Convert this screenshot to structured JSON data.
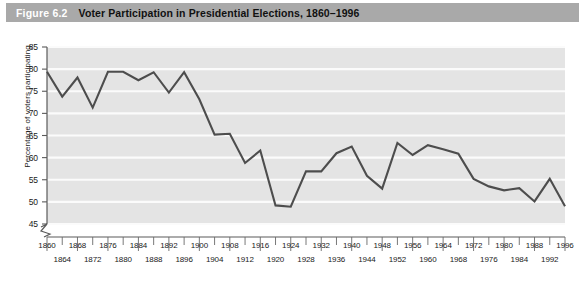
{
  "figure": {
    "number": "Figure 6.2",
    "title": "Voter Participation in Presidential Elections, 1860–1996"
  },
  "colors": {
    "title_bar": "#a9a9a9",
    "figure_number_text": "#ffffff",
    "title_text": "#111111",
    "plot_background": "#e4e4e4",
    "gridline": "#f7f7f7",
    "line": "#4d4d4d",
    "axis": "#5a5a5a",
    "page_background": "#ffffff"
  },
  "chart_data": {
    "type": "line",
    "title": "Voter Participation in Presidential Elections, 1860–1996",
    "xlabel": "",
    "ylabel": "Percentage of voters participating",
    "ylim": [
      45,
      85
    ],
    "yticks": [
      45,
      50,
      55,
      60,
      65,
      70,
      75,
      80,
      85
    ],
    "grid": true,
    "legend": null,
    "axis_break": true,
    "x": [
      1860,
      1864,
      1868,
      1872,
      1876,
      1880,
      1884,
      1888,
      1892,
      1896,
      1900,
      1904,
      1908,
      1912,
      1916,
      1920,
      1924,
      1928,
      1932,
      1936,
      1940,
      1944,
      1948,
      1952,
      1956,
      1960,
      1964,
      1968,
      1972,
      1976,
      1980,
      1984,
      1988,
      1992,
      1996
    ],
    "xticks_top": [
      1860,
      1868,
      1876,
      1884,
      1892,
      1900,
      1908,
      1916,
      1924,
      1932,
      1940,
      1948,
      1956,
      1964,
      1972,
      1980,
      1988,
      1996
    ],
    "xticks_bottom": [
      1864,
      1872,
      1880,
      1888,
      1896,
      1904,
      1912,
      1920,
      1928,
      1936,
      1944,
      1952,
      1960,
      1968,
      1976,
      1984,
      1992
    ],
    "values": [
      79.4,
      73.8,
      78.1,
      71.3,
      79.4,
      79.4,
      77.5,
      79.3,
      74.7,
      79.3,
      73.2,
      65.2,
      65.4,
      58.8,
      61.6,
      49.2,
      48.9,
      56.9,
      56.9,
      61.0,
      62.5,
      55.9,
      53.0,
      63.3,
      60.6,
      62.8,
      61.9,
      60.9,
      55.2,
      53.5,
      52.6,
      53.1,
      50.1,
      55.2,
      49.0
    ]
  },
  "y_axis": {
    "title": "Percentage of voters participating",
    "ticks": [
      "85",
      "80",
      "75",
      "70",
      "65",
      "60",
      "55",
      "50",
      "45"
    ]
  },
  "x_axis": {
    "labels_top": [
      "1860",
      "1868",
      "1876",
      "1884",
      "1892",
      "1900",
      "1908",
      "1916",
      "1924",
      "1932",
      "1940",
      "1948",
      "1956",
      "1964",
      "1972",
      "1980",
      "1988",
      "1996"
    ],
    "labels_bottom": [
      "1864",
      "1872",
      "1880",
      "1888",
      "1896",
      "1904",
      "1912",
      "1920",
      "1928",
      "1936",
      "1944",
      "1952",
      "1960",
      "1968",
      "1976",
      "1984",
      "1992"
    ]
  }
}
